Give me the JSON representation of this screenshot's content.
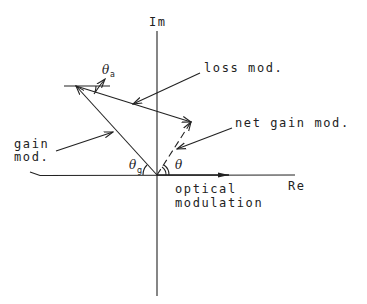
{
  "diagram": {
    "type": "phasor diagram",
    "axes": {
      "imaginary_label": "Im",
      "real_label": "Re"
    },
    "vectors": [
      {
        "name": "optical modulation",
        "label_line1": "optical",
        "label_line2": "modulation",
        "style": "solid",
        "direction": "along Re axis"
      },
      {
        "name": "gain mod.",
        "label_line1": "gain",
        "label_line2": "mod.",
        "style": "solid"
      },
      {
        "name": "loss mod.",
        "label": "loss mod.",
        "style": "solid"
      },
      {
        "name": "net gain mod.",
        "label": "net gain mod.",
        "style": "dashed"
      }
    ],
    "angles": {
      "theta_a": {
        "symbol": "θ",
        "subscript": "a"
      },
      "theta_g": {
        "symbol": "θ",
        "subscript": "g"
      },
      "theta": {
        "symbol": "θ"
      }
    },
    "colors": {
      "ink": "#222222",
      "background": "#ffffff"
    }
  }
}
